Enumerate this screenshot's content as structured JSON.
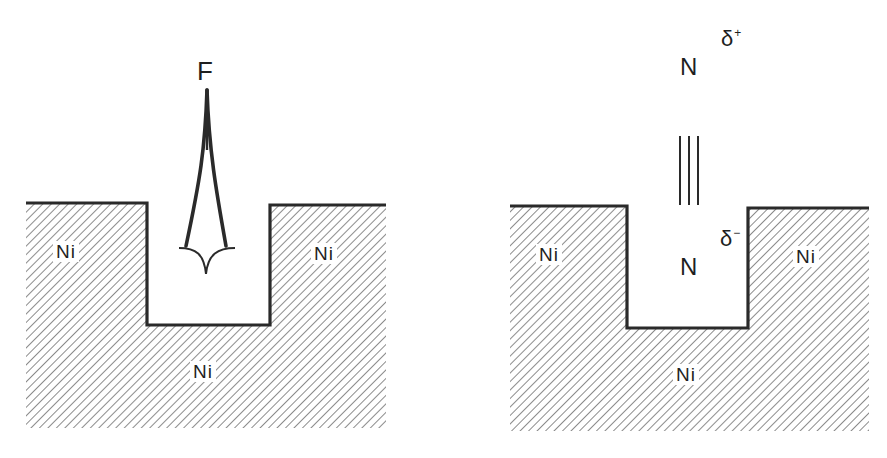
{
  "diagram": {
    "colors": {
      "line": "#2a2a2a",
      "hatch": "#6e6e6e",
      "text": "#1f1f1f",
      "background": "#ffffff"
    },
    "left_panel": {
      "probe_label": "F",
      "probe_shape": "tapered-spike-with-cusped-base",
      "substrate_labels": [
        "Ni",
        "Ni",
        "Ni"
      ]
    },
    "right_panel": {
      "top_atom": "N",
      "top_charge": "δ",
      "top_charge_sign": "+",
      "bond": "triple-bond",
      "bottom_atom": "N",
      "bottom_charge": "δ",
      "bottom_charge_sign": "−",
      "substrate_labels": [
        "Ni",
        "Ni",
        "Ni"
      ]
    }
  }
}
